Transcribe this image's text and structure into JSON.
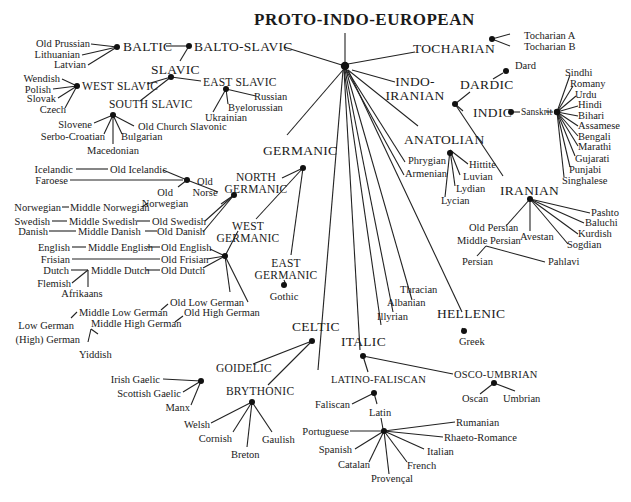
{
  "title": "PROTO-INDO-EUROPEAN",
  "branches": {
    "balto_slavic": "BALTO-SLAVIC",
    "baltic": "BALTIC",
    "baltic_langs": [
      "Old Prussian",
      "Lithuanian",
      "Latvian"
    ],
    "slavic": "SLAVIC",
    "west_slavic": "WEST SLAVIC",
    "west_slavic_langs": [
      "Wendish",
      "Polish",
      "Slovak",
      "Czech"
    ],
    "east_slavic": "EAST SLAVIC",
    "east_slavic_langs": [
      "Russian",
      "Byelorussian",
      "Ukrainian"
    ],
    "south_slavic": "SOUTH SLAVIC",
    "south_slavic_langs": [
      "Slovene",
      "Serbo-Croatian",
      "Macedonian",
      "Bulgarian",
      "Old Church Slavonic"
    ],
    "tocharian": "TOCHARIAN",
    "tocharian_langs": [
      "Tocharian A",
      "Tocharian B"
    ],
    "indo_iranian": "INDO-\nIRANIAN",
    "dardic": "DARDIC",
    "dardic_langs": [
      "Dard"
    ],
    "indic": "INDIC",
    "sanskrit": "Sanskrit",
    "indic_langs": [
      "Sindhi",
      "Romany",
      "Urdu",
      "Hindi",
      "Bihari",
      "Assamese",
      "Bengali",
      "Marathi",
      "Gujarati",
      "Punjabi",
      "Singhalese"
    ],
    "iranian": "IRANIAN",
    "iranian_langs": [
      "Pashto",
      "Baluchi",
      "Kurdish",
      "Sogdian",
      "Avestan",
      "Old Persian",
      "Middle Persian",
      "Persian",
      "Pahlavi"
    ],
    "anatolian": "ANATOLIAN",
    "anatolian_langs": [
      "Hittite",
      "Luvian",
      "Lydian",
      "Lycian"
    ],
    "independent_langs": [
      "Phrygian",
      "Armenian",
      "Thracian",
      "Albanian",
      "Illyrian"
    ],
    "hellenic": "HELLENIC",
    "hellenic_langs": [
      "Greek"
    ],
    "germanic": "GERMANIC",
    "north_germanic": "NORTH\nGERMANIC",
    "old_norse": "Old\nNorse",
    "north_germanic_langs": [
      "Icelandic",
      "Old Icelandic",
      "Faroese",
      "Old\nNorwegian",
      "Norwegian",
      "Middle Norwegian",
      "Swedish",
      "Middle Swedish",
      "Old Swedish",
      "Danish",
      "Middle Danish",
      "Old Danish"
    ],
    "west_germanic": "WEST\nGERMANIC",
    "west_germanic_langs": [
      "English",
      "Middle English",
      "Old English",
      "Frisian",
      "Old Frisian",
      "Dutch",
      "Middle Dutch",
      "Old Dutch",
      "Flemish",
      "Afrikaans",
      "Old Low German",
      "Middle Low German",
      "Low German",
      "Old High German",
      "Middle High German",
      "(High) German",
      "Yiddish"
    ],
    "east_germanic": "EAST\nGERMANIC",
    "east_germanic_langs": [
      "Gothic"
    ],
    "celtic": "CELTIC",
    "goidelic": "GOIDELIC",
    "goidelic_langs": [
      "Irish Gaelic",
      "Scottish Gaelic",
      "Manx"
    ],
    "brythonic": "BRYTHONIC",
    "brythonic_langs": [
      "Welsh",
      "Cornish",
      "Breton",
      "Gaulish"
    ],
    "italic": "ITALIC",
    "latino_faliscan": "LATINO-FALISCAN",
    "latino_faliscan_langs": [
      "Faliscan",
      "Latin"
    ],
    "romance_langs": [
      "Portuguese",
      "Spanish",
      "Catalan",
      "Provençal",
      "French",
      "Italian",
      "Rhaeto-Romance",
      "Rumanian"
    ],
    "osco_umbrian": "OSCO-UMBRIAN",
    "osco_umbrian_langs": [
      "Oscan",
      "Umbrian"
    ]
  }
}
